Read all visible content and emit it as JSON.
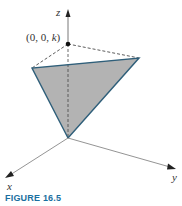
{
  "figure": {
    "caption": "FIGURE 16.5",
    "axes": {
      "x_label": "x",
      "y_label": "y",
      "z_label": "z"
    },
    "point_label": {
      "prefix": "(0, 0, ",
      "var": "k",
      "suffix": ")"
    },
    "colors": {
      "fill": "#b3b3b3",
      "edge": "#2f5f7a",
      "axis": "#555555",
      "caption": "#1a6fa0"
    }
  }
}
